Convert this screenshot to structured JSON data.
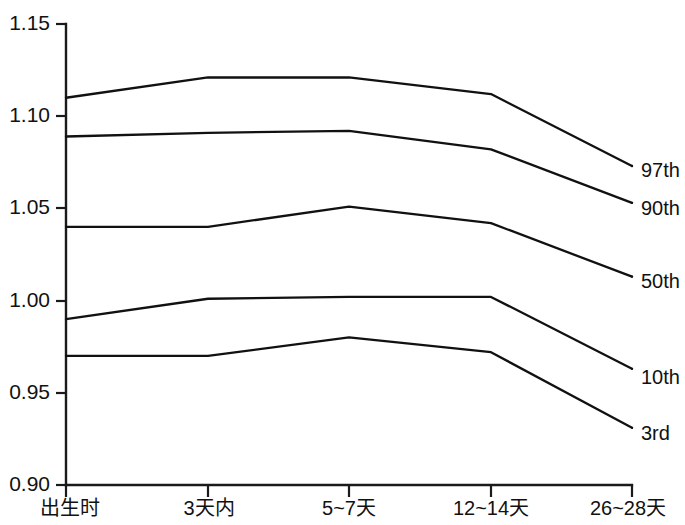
{
  "chart_data": {
    "type": "line",
    "title": "",
    "xlabel": "",
    "ylabel": "",
    "categories": [
      "出生时",
      "3天内",
      "5~7天",
      "12~14天",
      "26~28天"
    ],
    "ylim": [
      0.9,
      1.15
    ],
    "yticks": [
      0.9,
      0.95,
      1.0,
      1.05,
      1.1,
      1.15
    ],
    "ytick_labels": [
      "0.90",
      "0.95",
      "1.00",
      "1.05",
      "1.10",
      "1.15"
    ],
    "grid": false,
    "legend_position": "right-inline",
    "series": [
      {
        "name": "97th",
        "values": [
          1.11,
          1.121,
          1.121,
          1.112,
          1.073
        ]
      },
      {
        "name": "90th",
        "values": [
          1.089,
          1.091,
          1.092,
          1.082,
          1.053
        ]
      },
      {
        "name": "50th",
        "values": [
          1.04,
          1.04,
          1.051,
          1.042,
          1.013
        ]
      },
      {
        "name": "10th",
        "values": [
          0.99,
          1.001,
          1.002,
          1.002,
          0.963
        ]
      },
      {
        "name": "3rd",
        "values": [
          0.97,
          0.97,
          0.98,
          0.972,
          0.931
        ]
      }
    ]
  },
  "axes": {
    "y_tick_0": "0.90",
    "y_tick_1": "0.95",
    "y_tick_2": "1.00",
    "y_tick_3": "1.05",
    "y_tick_4": "1.10",
    "y_tick_5": "1.15",
    "x_tick_0": "出生时",
    "x_tick_1": "3天内",
    "x_tick_2": "5~7天",
    "x_tick_3": "12~14天",
    "x_tick_4": "26~28天"
  },
  "legend": {
    "item_0": "97th",
    "item_1": "90th",
    "item_2": "50th",
    "item_3": "10th",
    "item_4": "3rd"
  },
  "colors": {
    "line": "#111111",
    "axis": "#1a1a1a",
    "background": "#ffffff"
  }
}
